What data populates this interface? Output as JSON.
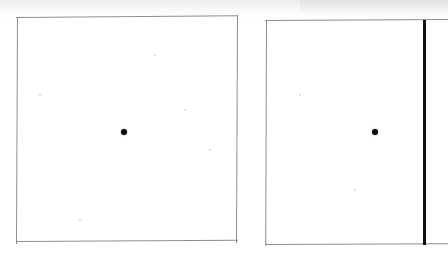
{
  "scan": {
    "title": "Two panel scanned figure",
    "background_color": "#ffffff",
    "width": 448,
    "height": 254
  },
  "panels": [
    {
      "id": "left-panel",
      "label": "Left panel",
      "border_color": "#8d8d8d",
      "fill_color": "#ffffff",
      "x": 16,
      "y": 15,
      "width": 222,
      "height": 227,
      "skew_note": "slight scan skew, top edge dips right to left",
      "marker": {
        "name": "center-dot",
        "color": "#0d0d0d",
        "x": 124,
        "y": 132,
        "diameter": 6
      },
      "vertical_rule": null
    },
    {
      "id": "right-panel",
      "label": "Right panel",
      "border_color": "#8d8d8d",
      "fill_color": "#ffffff",
      "x": 265,
      "y": 18,
      "width": 183,
      "height": 228,
      "skew_note": "slight scan skew, extends past right image edge",
      "marker": {
        "name": "center-dot",
        "color": "#0d0d0d",
        "x": 375,
        "y": 132,
        "diameter": 6
      },
      "vertical_rule": {
        "name": "fold-line",
        "color": "#111111",
        "x": 423,
        "top": 20,
        "bottom": 245,
        "thickness": 3
      }
    }
  ],
  "artifacts": {
    "top_tint_label": "scanner shadow band",
    "specks": [
      {
        "x": 155,
        "y": 55,
        "r": 1
      },
      {
        "x": 210,
        "y": 150,
        "r": 1
      },
      {
        "x": 80,
        "y": 220,
        "r": 1
      },
      {
        "x": 300,
        "y": 95,
        "r": 1
      },
      {
        "x": 355,
        "y": 190,
        "r": 1
      },
      {
        "x": 40,
        "y": 95,
        "r": 1
      },
      {
        "x": 185,
        "y": 110,
        "r": 1
      }
    ]
  }
}
